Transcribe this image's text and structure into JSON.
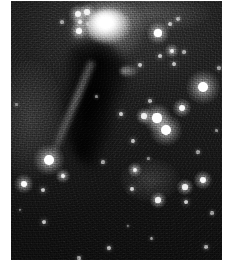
{
  "image": {
    "kind": "astronomical-photograph",
    "title": "Cometary reflection nebula with dark dust column",
    "palette": "grayscale",
    "width": 230,
    "height": 268,
    "background_color": "#ffffff",
    "sky_color": "#202020",
    "star_color": "#ffffff",
    "nebula_color": "#f2f2f2",
    "dust_color": "#0d0d0d"
  },
  "plate": {
    "left": 11,
    "top": 1,
    "width": 211,
    "height": 259
  },
  "nebula": {
    "head": {
      "name": "bright-nebula-head",
      "cx": 108,
      "cy": 26,
      "rx": 22,
      "ry": 17,
      "brightness": 1.0
    },
    "halo": {
      "name": "nebula-outer-halo",
      "cx": 107,
      "cy": 30,
      "rx": 38,
      "ry": 30,
      "brightness": 0.42
    },
    "knot": {
      "name": "reflection-knot",
      "cx": 129,
      "cy": 71,
      "rx": 9,
      "ry": 6,
      "brightness": 0.5
    },
    "dust_column": {
      "name": "dark-dust-column",
      "x": 60,
      "y": 38,
      "width": 68,
      "height": 132,
      "opacity": 0.85
    },
    "filament": {
      "name": "bright-rim-filament",
      "x1": 92,
      "y1": 58,
      "x2": 50,
      "y2": 158,
      "brightness": 0.35
    }
  },
  "stars": [
    {
      "name": "star-chain-a",
      "x": 78,
      "y": 14,
      "r": 3.0,
      "mag": 0.9
    },
    {
      "name": "star-chain-b",
      "x": 87,
      "y": 12,
      "r": 2.6,
      "mag": 0.88
    },
    {
      "name": "star-chain-c",
      "x": 80,
      "y": 22,
      "r": 2.4,
      "mag": 0.82
    },
    {
      "name": "star-chain-d",
      "x": 88,
      "y": 24,
      "r": 2.0,
      "mag": 0.78
    },
    {
      "name": "star-chain-e",
      "x": 79,
      "y": 31,
      "r": 2.8,
      "mag": 0.92
    },
    {
      "name": "star-faint-upper-left",
      "x": 62,
      "y": 22,
      "r": 1.6,
      "mag": 0.65
    },
    {
      "name": "star-upper-right-bright",
      "x": 158,
      "y": 33,
      "r": 3.6,
      "mag": 1.0
    },
    {
      "name": "star-upper-right-small-a",
      "x": 170,
      "y": 24,
      "r": 2.0,
      "mag": 0.78
    },
    {
      "name": "star-upper-right-small-b",
      "x": 178,
      "y": 19,
      "r": 1.8,
      "mag": 0.7
    },
    {
      "name": "star-upper-right-small-c",
      "x": 172,
      "y": 51,
      "r": 2.4,
      "mag": 0.84
    },
    {
      "name": "star-upper-right-small-d",
      "x": 160,
      "y": 56,
      "r": 2.0,
      "mag": 0.78
    },
    {
      "name": "star-upper-right-small-e",
      "x": 184,
      "y": 52,
      "r": 1.7,
      "mag": 0.68
    },
    {
      "name": "star-upper-right-small-f",
      "x": 174,
      "y": 64,
      "r": 2.0,
      "mag": 0.76
    },
    {
      "name": "star-right-edge-faint",
      "x": 219,
      "y": 68,
      "r": 1.6,
      "mag": 0.62
    },
    {
      "name": "star-right-big",
      "x": 203,
      "y": 87,
      "r": 5.4,
      "mag": 1.0
    },
    {
      "name": "star-mid-right-a",
      "x": 182,
      "y": 108,
      "r": 3.0,
      "mag": 0.92
    },
    {
      "name": "star-mid-right-b",
      "x": 157,
      "y": 118,
      "r": 4.6,
      "mag": 1.0
    },
    {
      "name": "star-mid-right-c",
      "x": 144,
      "y": 116,
      "r": 2.6,
      "mag": 0.86
    },
    {
      "name": "star-mid-right-d",
      "x": 166,
      "y": 130,
      "r": 5.2,
      "mag": 1.0
    },
    {
      "name": "star-mid-right-e",
      "x": 150,
      "y": 101,
      "r": 1.8,
      "mag": 0.7
    },
    {
      "name": "star-mid-right-f",
      "x": 121,
      "y": 114,
      "r": 2.2,
      "mag": 0.8
    },
    {
      "name": "star-mid-right-g",
      "x": 133,
      "y": 141,
      "r": 2.0,
      "mag": 0.76
    },
    {
      "name": "star-knot-companion",
      "x": 140,
      "y": 65,
      "r": 2.0,
      "mag": 0.78
    },
    {
      "name": "star-lower-left-big",
      "x": 49,
      "y": 160,
      "r": 5.0,
      "mag": 1.0
    },
    {
      "name": "star-lower-left-a",
      "x": 24,
      "y": 184,
      "r": 3.2,
      "mag": 0.95
    },
    {
      "name": "star-lower-left-b",
      "x": 43,
      "y": 190,
      "r": 2.0,
      "mag": 0.78
    },
    {
      "name": "star-lower-left-c",
      "x": 63,
      "y": 176,
      "r": 2.4,
      "mag": 0.84
    },
    {
      "name": "star-lower-mid-a",
      "x": 135,
      "y": 170,
      "r": 2.4,
      "mag": 0.84
    },
    {
      "name": "star-lower-mid-b",
      "x": 132,
      "y": 189,
      "r": 2.2,
      "mag": 0.82
    },
    {
      "name": "star-lower-mid-c",
      "x": 158,
      "y": 200,
      "r": 2.6,
      "mag": 0.86
    },
    {
      "name": "star-lower-right-a",
      "x": 185,
      "y": 187,
      "r": 2.6,
      "mag": 0.86
    },
    {
      "name": "star-lower-right-b",
      "x": 203,
      "y": 180,
      "r": 3.0,
      "mag": 0.92
    },
    {
      "name": "star-lower-right-c",
      "x": 186,
      "y": 202,
      "r": 2.2,
      "mag": 0.8
    },
    {
      "name": "star-lower-right-d",
      "x": 212,
      "y": 213,
      "r": 1.6,
      "mag": 0.62
    },
    {
      "name": "star-lower-right-e",
      "x": 206,
      "y": 247,
      "r": 1.8,
      "mag": 0.68
    },
    {
      "name": "star-bottom-a",
      "x": 44,
      "y": 222,
      "r": 2.0,
      "mag": 0.76
    },
    {
      "name": "star-bottom-b",
      "x": 109,
      "y": 248,
      "r": 1.8,
      "mag": 0.7
    },
    {
      "name": "star-bottom-c",
      "x": 151,
      "y": 238,
      "r": 1.5,
      "mag": 0.6
    },
    {
      "name": "star-bottom-d",
      "x": 128,
      "y": 226,
      "r": 1.4,
      "mag": 0.58
    },
    {
      "name": "star-bottom-e",
      "x": 79,
      "y": 258,
      "r": 1.6,
      "mag": 0.62
    },
    {
      "name": "star-left-faint-a",
      "x": 16,
      "y": 104,
      "r": 1.5,
      "mag": 0.6
    },
    {
      "name": "star-left-faint-b",
      "x": 20,
      "y": 210,
      "r": 1.4,
      "mag": 0.56
    },
    {
      "name": "star-center-faint-a",
      "x": 103,
      "y": 162,
      "r": 1.6,
      "mag": 0.64
    },
    {
      "name": "star-center-faint-b",
      "x": 96,
      "y": 96,
      "r": 1.5,
      "mag": 0.58
    },
    {
      "name": "star-center-faint-c",
      "x": 148,
      "y": 158,
      "r": 1.5,
      "mag": 0.58
    },
    {
      "name": "star-right-faint-a",
      "x": 216,
      "y": 130,
      "r": 1.5,
      "mag": 0.58
    },
    {
      "name": "star-right-faint-b",
      "x": 198,
      "y": 152,
      "r": 1.6,
      "mag": 0.62
    }
  ],
  "diffuse_glows": [
    {
      "name": "glow-lower-mid",
      "cx": 150,
      "cy": 180,
      "rx": 30,
      "ry": 22,
      "brightness": 0.16
    },
    {
      "name": "glow-left-band",
      "cx": 30,
      "cy": 120,
      "rx": 34,
      "ry": 60,
      "brightness": 0.12
    },
    {
      "name": "glow-upper-band",
      "cx": 150,
      "cy": 14,
      "rx": 60,
      "ry": 18,
      "brightness": 0.14
    }
  ]
}
